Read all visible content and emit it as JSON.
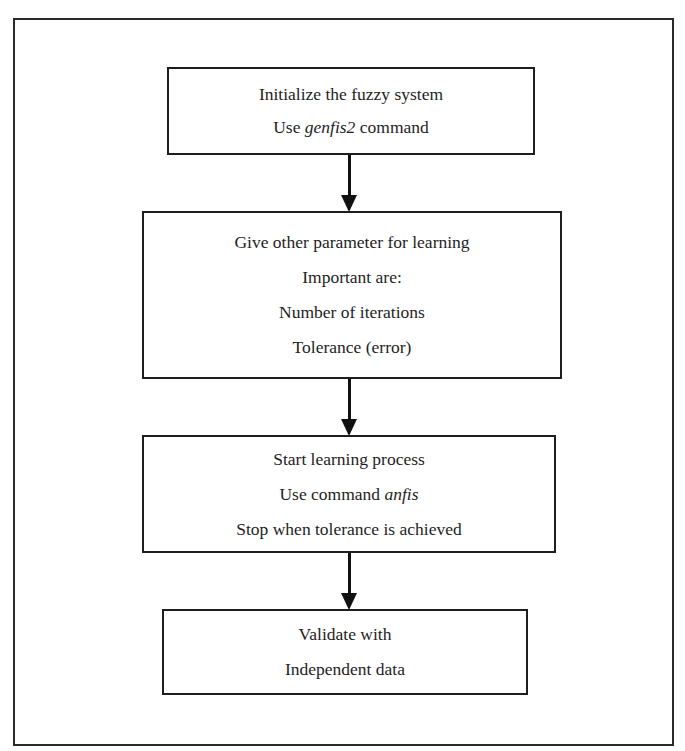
{
  "diagram": {
    "type": "flowchart",
    "direction": "top-to-bottom",
    "steps": [
      {
        "id": "init",
        "lines": [
          {
            "parts": [
              {
                "text": "Initialize the fuzzy system",
                "italic": false
              }
            ]
          },
          {
            "parts": [
              {
                "text": "Use ",
                "italic": false
              },
              {
                "text": "genfis2",
                "italic": true
              },
              {
                "text": " command",
                "italic": false
              }
            ]
          }
        ]
      },
      {
        "id": "params",
        "lines": [
          {
            "parts": [
              {
                "text": "Give other parameter for learning",
                "italic": false
              }
            ]
          },
          {
            "parts": [
              {
                "text": "Important are:",
                "italic": false
              }
            ]
          },
          {
            "parts": [
              {
                "text": "Number of iterations",
                "italic": false
              }
            ]
          },
          {
            "parts": [
              {
                "text": "Tolerance (error)",
                "italic": false
              }
            ]
          }
        ]
      },
      {
        "id": "learn",
        "lines": [
          {
            "parts": [
              {
                "text": "Start learning process",
                "italic": false
              }
            ]
          },
          {
            "parts": [
              {
                "text": "Use command ",
                "italic": false
              },
              {
                "text": "anfis",
                "italic": true
              }
            ]
          },
          {
            "parts": [
              {
                "text": "Stop when tolerance is achieved",
                "italic": false
              }
            ]
          }
        ]
      },
      {
        "id": "validate",
        "lines": [
          {
            "parts": [
              {
                "text": "Validate with",
                "italic": false
              }
            ]
          },
          {
            "parts": [
              {
                "text": "Independent data",
                "italic": false
              }
            ]
          }
        ]
      }
    ],
    "edges": [
      {
        "from": "init",
        "to": "params"
      },
      {
        "from": "params",
        "to": "learn"
      },
      {
        "from": "learn",
        "to": "validate"
      }
    ],
    "colors": {
      "stroke": "#1e1e1e",
      "background": "#ffffff",
      "text": "#1e1e1e"
    }
  }
}
